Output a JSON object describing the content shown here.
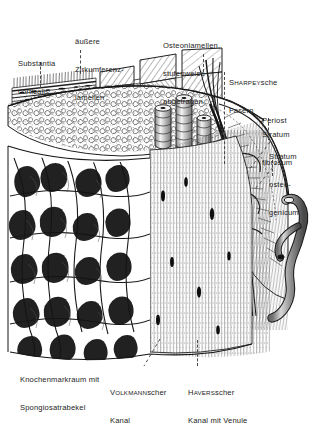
{
  "figure": {
    "language": "de",
    "style": "ink-hatching anatomical illustration",
    "background_color": "#ffffff",
    "ink_color": "#1a1a1a",
    "label_color": "#242424",
    "leader_color": "#4a4a4a"
  },
  "labels": {
    "substantia_corticalis": {
      "line1": "Substantia",
      "line2": "corticalis"
    },
    "aeussere_zirkumferenzlamellen": {
      "line1": "äußere",
      "line2": "Zirkumferenz-",
      "line3": "lamellen"
    },
    "osteonlamellen": {
      "line1": "Osteonlamellen,",
      "line2": "stufenweise",
      "line3": "abgetragen"
    },
    "sharpeysche_fasern": {
      "eponym": "S",
      "eponym_smallcaps": "HARPEY",
      "eponym_tail": "sche",
      "line2": "Fasern"
    },
    "periost": {
      "line1": "Periost"
    },
    "stratum_fibrosum": {
      "line1": "Stratum",
      "line2": "fibrosum"
    },
    "stratum_osteogenicum": {
      "line1": "Stratum",
      "line2": "osteo-",
      "line3": "genicum"
    },
    "knochenmarkraum": {
      "line1": "Knochenmarkraum mit",
      "line2": "Spongiosatrabekel"
    },
    "volkmannscher_kanal": {
      "eponym": "V",
      "eponym_smallcaps": "OLKMANN",
      "eponym_tail": "scher",
      "line2": "Kanal"
    },
    "haversscher_kanal": {
      "eponym": "H",
      "eponym_smallcaps": "AVERS",
      "eponym_tail": "scher",
      "line2": "Kanal mit Venule"
    }
  }
}
